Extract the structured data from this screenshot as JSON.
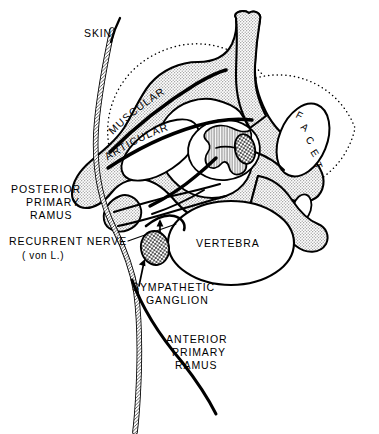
{
  "figure": {
    "background_color": "#ffffff",
    "ink_color": "#000000",
    "bone_fill_color": "#d8d8d8"
  },
  "labels": {
    "skin": "SKIN",
    "muscular": "MUSCULAR",
    "articular": "ARTICULAR",
    "posterior_primary_ramus": [
      "POSTERIOR",
      "PRIMARY",
      "RAMUS"
    ],
    "recurrent_nerve": "RECURRENT NERVE",
    "recurrent_nerve_sub": "( von L.)",
    "sympathetic_ganglion": [
      "SYMPATHETIC",
      "GANGLION"
    ],
    "anterior_primary_ramus": [
      "ANTERIOR",
      "PRIMARY",
      "RAMUS"
    ],
    "vertebra": "VERTEBRA",
    "facet_letters": [
      "F",
      "A",
      "C",
      "E",
      "T"
    ]
  },
  "structures": {
    "spinous_process": "spinous-process",
    "lamina": "lamina",
    "facet_joint": "facet-joint",
    "transverse_process": "transverse-process",
    "vertebral_body": "vertebral-body",
    "spinal_cord": "spinal-cord",
    "dural_sac": "dural-sac",
    "dorsal_root_ganglion": "dorsal-root-ganglion",
    "sympathetic_ganglion": "sympathetic-ganglion",
    "reference_circle_left": "dotted-reference-circle-left",
    "reference_circle_right": "dotted-reference-circle-right"
  }
}
